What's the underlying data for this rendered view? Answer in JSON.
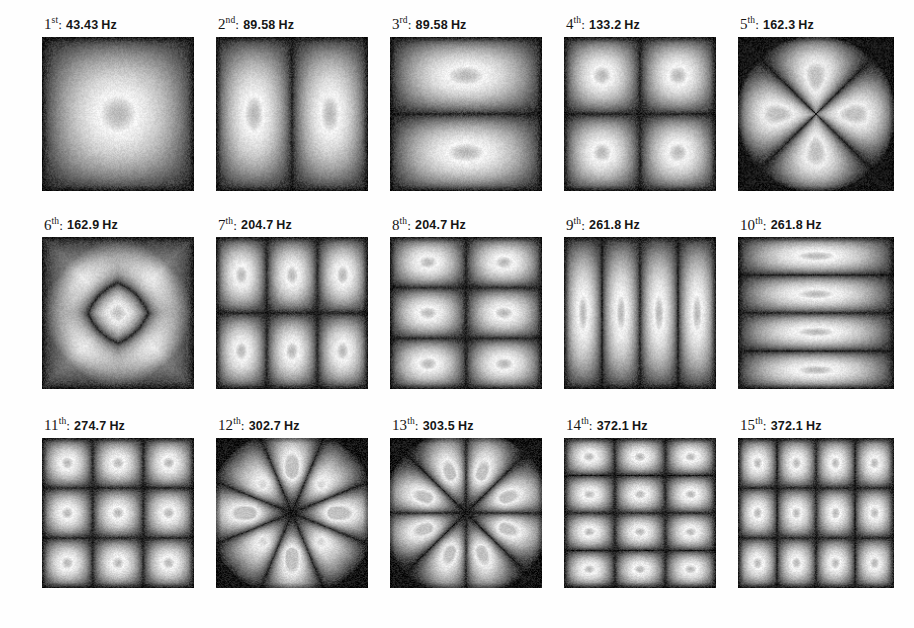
{
  "figure": {
    "unit": "Hz",
    "separator": ":",
    "rows": 3,
    "columns": 5,
    "colormap": "grayscale",
    "background_color": "#ffffff",
    "plate_dark_color": "#1c1c1c",
    "plate_bright_color": "#fdfdfd"
  },
  "chart_data": {
    "type": "heatmap",
    "xlabel": "",
    "ylabel": "",
    "grid": false,
    "legend": "none",
    "colormap": "grayscale",
    "panel_layout": {
      "rows": 3,
      "cols": 5
    },
    "categories": [
      "1st",
      "2nd",
      "3rd",
      "4th",
      "5th",
      "6th",
      "7th",
      "8th",
      "9th",
      "10th",
      "11th",
      "12th",
      "13th",
      "14th",
      "15th"
    ],
    "values": [
      43.43,
      89.58,
      89.58,
      133.2,
      162.3,
      162.9,
      204.7,
      204.7,
      261.8,
      261.8,
      274.7,
      302.7,
      303.5,
      372.1,
      372.1
    ],
    "value_unit": "Hz",
    "panels": [
      {
        "index": 1,
        "ordinal_number": "1",
        "ordinal_suffix": "st",
        "frequency": "43.43",
        "unit": "Hz",
        "label": "1st:  43.43 Hz",
        "mode_kind": "grid",
        "nx": 1,
        "ny": 1,
        "dimple": true
      },
      {
        "index": 2,
        "ordinal_number": "2",
        "ordinal_suffix": "nd",
        "frequency": "89.58",
        "unit": "Hz",
        "label": "2nd:  89.58 Hz",
        "mode_kind": "grid",
        "nx": 2,
        "ny": 1,
        "dimple": true
      },
      {
        "index": 3,
        "ordinal_number": "3",
        "ordinal_suffix": "rd",
        "frequency": "89.58",
        "unit": "Hz",
        "label": "3rd:  89.58 Hz",
        "mode_kind": "grid",
        "nx": 1,
        "ny": 2,
        "dimple": true
      },
      {
        "index": 4,
        "ordinal_number": "4",
        "ordinal_suffix": "th",
        "frequency": "133.2",
        "unit": "Hz",
        "label": "4th:  133.2 Hz",
        "mode_kind": "grid",
        "nx": 2,
        "ny": 2,
        "dimple": true
      },
      {
        "index": 5,
        "ordinal_number": "5",
        "ordinal_suffix": "th",
        "frequency": "162.3",
        "unit": "Hz",
        "label": "5th:  162.3 Hz",
        "mode_kind": "diagonal-x",
        "lobes": 4,
        "dimple": true
      },
      {
        "index": 6,
        "ordinal_number": "6",
        "ordinal_suffix": "th",
        "frequency": "162.9",
        "unit": "Hz",
        "label": "6th:  162.9 Hz",
        "mode_kind": "ring",
        "rings": 2,
        "dimple": true
      },
      {
        "index": 7,
        "ordinal_number": "7",
        "ordinal_suffix": "th",
        "frequency": "204.7",
        "unit": "Hz",
        "label": "7th:  204.7 Hz",
        "mode_kind": "grid",
        "nx": 3,
        "ny": 2,
        "dimple": true
      },
      {
        "index": 8,
        "ordinal_number": "8",
        "ordinal_suffix": "th",
        "frequency": "204.7",
        "unit": "Hz",
        "label": "8th:  204.7 Hz",
        "mode_kind": "grid",
        "nx": 2,
        "ny": 3,
        "dimple": true
      },
      {
        "index": 9,
        "ordinal_number": "9",
        "ordinal_suffix": "th",
        "frequency": "261.8",
        "unit": "Hz",
        "label": "9th:  261.8 Hz",
        "mode_kind": "grid",
        "nx": 4,
        "ny": 1,
        "dimple": true
      },
      {
        "index": 10,
        "ordinal_number": "10",
        "ordinal_suffix": "th",
        "frequency": "261.8",
        "unit": "Hz",
        "label": "10th: 261.8 Hz",
        "mode_kind": "grid",
        "nx": 1,
        "ny": 4,
        "dimple": true
      },
      {
        "index": 11,
        "ordinal_number": "11",
        "ordinal_suffix": "th",
        "frequency": "274.7",
        "unit": "Hz",
        "label": "11th: 274.7 Hz",
        "mode_kind": "grid",
        "nx": 3,
        "ny": 3,
        "dimple": true
      },
      {
        "index": 12,
        "ordinal_number": "12",
        "ordinal_suffix": "th",
        "frequency": "302.7",
        "unit": "Hz",
        "label": "12th: 302.7 Hz",
        "mode_kind": "rosette",
        "lobes": 8,
        "rotation": 0,
        "dimple": true
      },
      {
        "index": 13,
        "ordinal_number": "13",
        "ordinal_suffix": "th",
        "frequency": "303.5",
        "unit": "Hz",
        "label": "13th: 303.5 Hz",
        "mode_kind": "rosette",
        "lobes": 8,
        "rotation": 22.5,
        "dimple": true
      },
      {
        "index": 14,
        "ordinal_number": "14",
        "ordinal_suffix": "th",
        "frequency": "372.1",
        "unit": "Hz",
        "label": "14th: 372.1 Hz",
        "mode_kind": "grid",
        "nx": 3,
        "ny": 4,
        "dimple": true
      },
      {
        "index": 15,
        "ordinal_number": "15",
        "ordinal_suffix": "th",
        "frequency": "372.1",
        "unit": "Hz",
        "label": "15th: 372.1 Hz",
        "mode_kind": "grid",
        "nx": 4,
        "ny": 3,
        "dimple": true
      }
    ]
  }
}
